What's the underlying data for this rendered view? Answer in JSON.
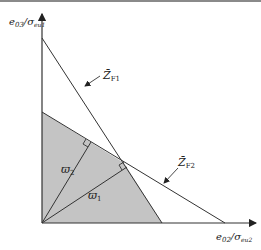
{
  "diagram": {
    "axes": {
      "y_label_main": "e",
      "y_label_sub": "03",
      "y_label_den": "σ",
      "y_label_den_sub": "eu1",
      "x_label_main": "e",
      "x_label_sub": "02",
      "x_label_den": "σ",
      "x_label_den_sub": "eu2"
    },
    "lines": [
      {
        "id": "Z_F1",
        "label_main": "Z̄",
        "label_sub": "F1"
      },
      {
        "id": "Z_F2",
        "label_main": "Z̄",
        "label_sub": "F2"
      }
    ],
    "vectors": [
      {
        "id": "w1",
        "label_main": "ϖ",
        "label_sub": "1"
      },
      {
        "id": "w2",
        "label_main": "ϖ",
        "label_sub": "2"
      }
    ],
    "colors": {
      "region_fill": "#c4c4c4",
      "line": "#333333"
    }
  }
}
